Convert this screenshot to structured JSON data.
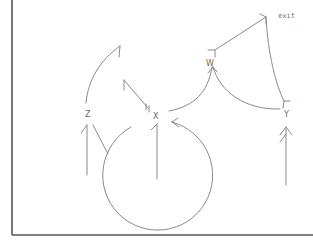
{
  "diagram": {
    "title": "",
    "style": "hand-drawn sketch",
    "colors": {
      "stroke": "#8a8a8a",
      "frame": "#555555",
      "text": "#6a6a6a",
      "background": "#ffffff"
    },
    "nodes": [
      {
        "id": "z",
        "label": "Z"
      },
      {
        "id": "x",
        "label": "X"
      },
      {
        "id": "w",
        "label": "W"
      },
      {
        "id": "y",
        "label": "Y"
      },
      {
        "id": "exit",
        "label": "exit"
      }
    ],
    "edges": [
      {
        "from": "entry-z",
        "to": "z",
        "kind": "arrow"
      },
      {
        "from": "z",
        "to": "loop-up",
        "kind": "arrow"
      },
      {
        "from": "x",
        "to": "x",
        "kind": "self-loop"
      },
      {
        "from": "entry-x",
        "to": "x",
        "kind": "line"
      },
      {
        "from": "x",
        "to": "w",
        "kind": "arrow"
      },
      {
        "from": "y",
        "to": "w",
        "kind": "arrow"
      },
      {
        "from": "w",
        "to": "exit",
        "kind": "line"
      },
      {
        "from": "exit",
        "to": "y",
        "kind": "arrow"
      },
      {
        "from": "entry-y",
        "to": "y",
        "kind": "arrow"
      },
      {
        "from": "z",
        "to": "circle",
        "kind": "line"
      }
    ]
  }
}
